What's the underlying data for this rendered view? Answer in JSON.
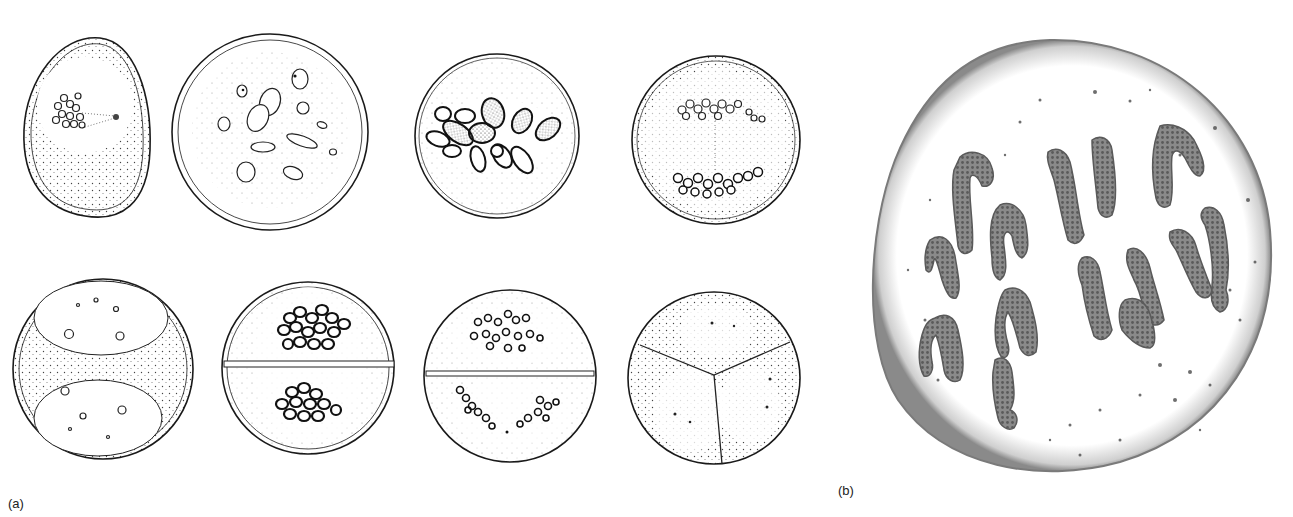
{
  "figure": {
    "panel_a": {
      "label": "(a)",
      "description": "Eight line drawings of cell nuclei stages during division (top row: 4 cells, bottom row: 4 cells)",
      "cells": [
        {
          "id": "a1",
          "row": 1,
          "shape": "oval",
          "content": "stippled cytoplasm with nucleus containing chromatin granules and centrosome"
        },
        {
          "id": "a2",
          "row": 1,
          "shape": "circle",
          "content": "scattered elongated bodies and small vesicles"
        },
        {
          "id": "a3",
          "row": 1,
          "shape": "circle",
          "content": "clustered dark elongated chromosomes"
        },
        {
          "id": "a4",
          "row": 1,
          "shape": "circle",
          "content": "two granular groups at poles with spindle line"
        },
        {
          "id": "a5",
          "row": 2,
          "shape": "circle",
          "content": "two oval daughter nuclei with small nucleoli in stippled cytoplasm"
        },
        {
          "id": "a6",
          "row": 2,
          "shape": "circle",
          "content": "divided by horizontal wall, dark granule cluster in each half"
        },
        {
          "id": "a7",
          "row": 2,
          "shape": "circle",
          "content": "divided by horizontal wall, ring granules in each half"
        },
        {
          "id": "a8",
          "row": 2,
          "shape": "circle",
          "content": "divided into three sectors, each with a nucleus"
        }
      ]
    },
    "panel_b": {
      "label": "(b)",
      "description": "Large round cell with twelve dark worm-like chromosomes and scattered dots"
    }
  },
  "colors": {
    "ink": "#1a1a1a",
    "stipple": "#555555",
    "chromosome": "#6e6e6e",
    "background": "#ffffff"
  }
}
